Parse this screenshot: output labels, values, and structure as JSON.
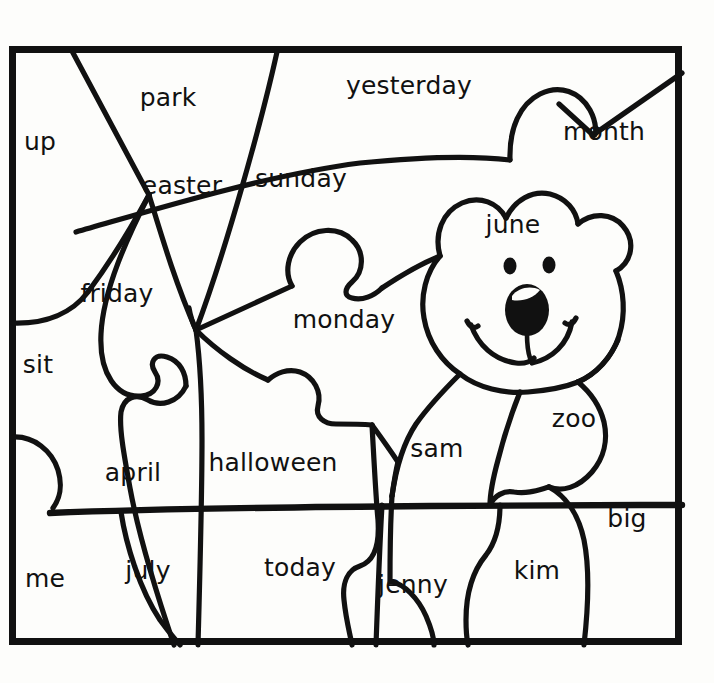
{
  "page": {
    "background_color": "#fdfdfb",
    "ink_color": "#111111"
  },
  "frame": {
    "x": 9,
    "y": 46,
    "width": 673,
    "height": 599,
    "stroke_width": 7
  },
  "picture": {
    "subject": "bear",
    "description": "Cartoon bear head and body drawn over an interlocking jigsaw puzzle grid, each puzzle piece labeled with a sight word."
  },
  "words": [
    {
      "id": "up",
      "label": "up",
      "x": 40,
      "y": 143
    },
    {
      "id": "park",
      "label": "park",
      "x": 168,
      "y": 99
    },
    {
      "id": "yesterday",
      "label": "yesterday",
      "x": 409,
      "y": 87
    },
    {
      "id": "month",
      "label": "month",
      "x": 604,
      "y": 133
    },
    {
      "id": "easter",
      "label": "easter",
      "x": 182,
      "y": 187
    },
    {
      "id": "sunday",
      "label": "sunday",
      "x": 301,
      "y": 180
    },
    {
      "id": "june",
      "label": "june",
      "x": 513,
      "y": 226
    },
    {
      "id": "friday",
      "label": "friday",
      "x": 117,
      "y": 295
    },
    {
      "id": "monday",
      "label": "monday",
      "x": 344,
      "y": 321
    },
    {
      "id": "sit",
      "label": "sit",
      "x": 38,
      "y": 366
    },
    {
      "id": "zoo",
      "label": "zoo",
      "x": 574,
      "y": 420
    },
    {
      "id": "april",
      "label": "april",
      "x": 133,
      "y": 474
    },
    {
      "id": "halloween",
      "label": "halloween",
      "x": 273,
      "y": 464
    },
    {
      "id": "sam",
      "label": "sam",
      "x": 437,
      "y": 450
    },
    {
      "id": "big",
      "label": "big",
      "x": 627,
      "y": 520
    },
    {
      "id": "me",
      "label": "me",
      "x": 45,
      "y": 580
    },
    {
      "id": "july",
      "label": "july",
      "x": 148,
      "y": 572
    },
    {
      "id": "today",
      "label": "today",
      "x": 300,
      "y": 569
    },
    {
      "id": "jenny",
      "label": "jenny",
      "x": 413,
      "y": 586
    },
    {
      "id": "kim",
      "label": "kim",
      "x": 537,
      "y": 572
    }
  ]
}
